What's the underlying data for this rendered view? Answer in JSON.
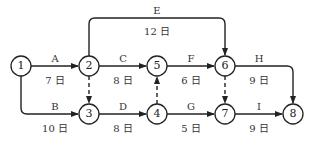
{
  "nodes": [
    {
      "id": "1",
      "x": 21,
      "y": 66
    },
    {
      "id": "2",
      "x": 89,
      "y": 66
    },
    {
      "id": "3",
      "x": 89,
      "y": 114
    },
    {
      "id": "4",
      "x": 157,
      "y": 114
    },
    {
      "id": "5",
      "x": 157,
      "y": 66
    },
    {
      "id": "6",
      "x": 225,
      "y": 66
    },
    {
      "id": "7",
      "x": 225,
      "y": 114
    },
    {
      "id": "8",
      "x": 293,
      "y": 114
    }
  ],
  "activities": [
    {
      "name": "A",
      "duration": "7 日",
      "from": "1",
      "to": "2"
    },
    {
      "name": "B",
      "duration": "10 日",
      "from": "1",
      "to": "3"
    },
    {
      "name": "C",
      "duration": "8 日",
      "from": "2",
      "to": "5"
    },
    {
      "name": "D",
      "duration": "8 日",
      "from": "3",
      "to": "4"
    },
    {
      "name": "E",
      "duration": "12 日",
      "from": "2",
      "to": "6"
    },
    {
      "name": "F",
      "duration": "6 日",
      "from": "5",
      "to": "6"
    },
    {
      "name": "G",
      "duration": "5 日",
      "from": "4",
      "to": "7"
    },
    {
      "name": "H",
      "duration": "9 日",
      "from": "6",
      "to": "8"
    },
    {
      "name": "I",
      "duration": "9 日",
      "from": "7",
      "to": "8"
    }
  ],
  "dummies": [
    {
      "from": "2",
      "to": "3"
    },
    {
      "from": "4",
      "to": "5"
    },
    {
      "from": "6",
      "to": "7"
    }
  ]
}
